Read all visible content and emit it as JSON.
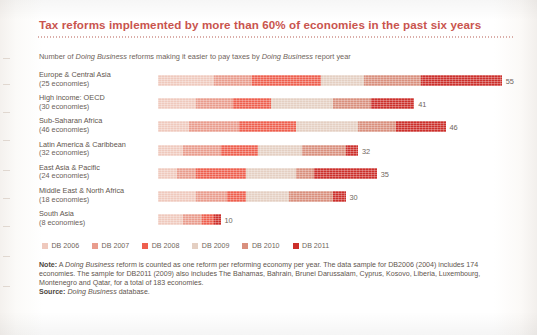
{
  "figure": {
    "title": "Tax reforms implemented by more than 60% of economies in the past six years",
    "subtitle_parts": {
      "a": "Number of ",
      "b_italic": "Doing Business",
      "c": " reforms making it easier to pay taxes by ",
      "d_italic": "Doing Business",
      "e": " report year"
    }
  },
  "chart_data": {
    "type": "bar",
    "orientation": "horizontal",
    "stacked": true,
    "title": "Tax reforms implemented by more than 60% of economies in the past six years",
    "subtitle": "Number of Doing Business reforms making it easier to pay taxes by Doing Business report year",
    "xlabel": "",
    "ylabel": "",
    "xlim": [
      0,
      62
    ],
    "grid": false,
    "legend_position": "bottom-left",
    "categories": [
      "Europe & Central Asia",
      "High income: OECD",
      "Sub-Saharan Africa",
      "Latin America & Caribbean",
      "East Asia & Pacific",
      "Middle East & North Africa",
      "South Asia"
    ],
    "category_subtitles": [
      "(25 economies)",
      "(30 economies)",
      "(46 economies)",
      "(32 economies)",
      "(24 economies)",
      "(18 economies)",
      "(8 economies)"
    ],
    "series": [
      {
        "name": "DB 2006",
        "color": "#efc9bd",
        "values": [
          9,
          6,
          5,
          4,
          3,
          6,
          4
        ]
      },
      {
        "name": "DB 2007",
        "color": "#e99c8d",
        "values": [
          6,
          6,
          8,
          6,
          3,
          5,
          3
        ]
      },
      {
        "name": "DB 2008",
        "color": "#ee5f4e",
        "values": [
          11,
          6,
          9,
          6,
          8,
          3,
          2
        ]
      },
      {
        "name": "DB 2009",
        "color": "#e4cfc2",
        "values": [
          7,
          10,
          10,
          7,
          8,
          7,
          0
        ]
      },
      {
        "name": "DB 2010",
        "color": "#d98f7d",
        "values": [
          9,
          6,
          6,
          7,
          3,
          7,
          0
        ]
      },
      {
        "name": "DB 2011",
        "color": "#cc2f2b",
        "values": [
          13,
          7,
          8,
          2,
          10,
          2,
          1
        ]
      }
    ],
    "totals": [
      55,
      41,
      46,
      32,
      35,
      30,
      10
    ],
    "total_labels": [
      "55",
      "41",
      "46",
      "32",
      "35",
      "30",
      "10"
    ],
    "units": "reforms"
  },
  "legend": {
    "items": [
      {
        "label": "DB 2006",
        "color": "#efc9bd"
      },
      {
        "label": "DB 2007",
        "color": "#e99c8d"
      },
      {
        "label": "DB 2008",
        "color": "#ee5f4e"
      },
      {
        "label": "DB 2009",
        "color": "#e4cfc2"
      },
      {
        "label": "DB 2010",
        "color": "#d98f7d"
      },
      {
        "label": "DB 2011",
        "color": "#cc2f2b"
      }
    ]
  },
  "notes": {
    "note_label": "Note:",
    "note_line1_a": " A ",
    "note_line1_italic": "Doing Business",
    "note_line1_b": " reform is counted as one reform per reforming economy per year. The data sample for DB2006 (2004)",
    "note_line2": "includes 174 economies. The sample for DB2011 (2009) also includes The Bahamas, Bahrain, Brunei Darussalam, Cyprus,",
    "note_line3": "Kosovo, Liberia, Luxembourg, Montenegro and Qatar, for a total of 183 economies.",
    "source_label": "Source:",
    "source_italic": " Doing Business",
    "source_tail": " database."
  }
}
